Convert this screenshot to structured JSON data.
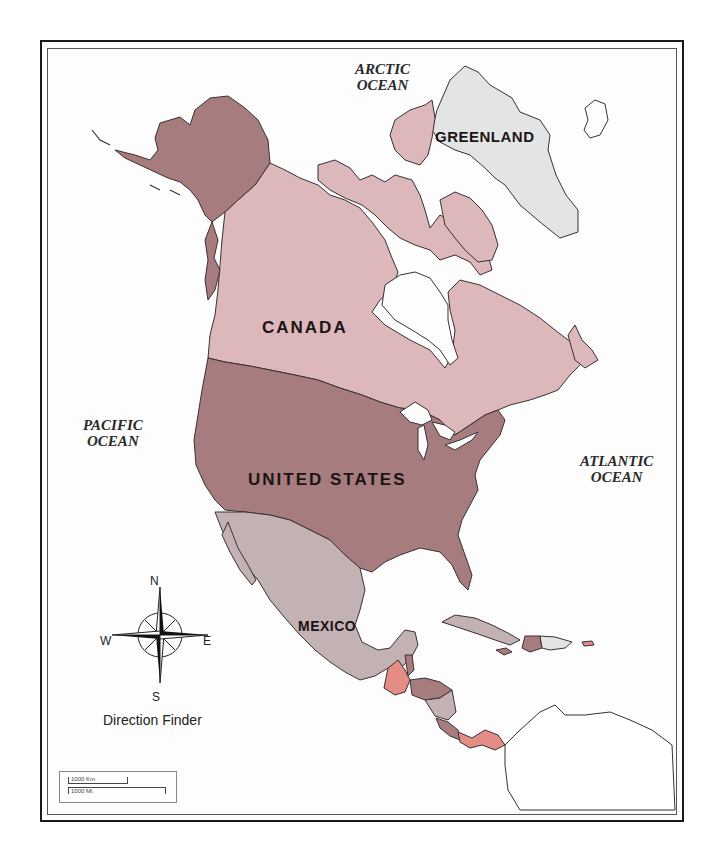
{
  "map": {
    "title": "North America",
    "colors": {
      "alaska_us": "#a67c7e",
      "united_states": "#a67c7e",
      "canada": "#dcb8ba",
      "greenland": "#e3e5e4",
      "mexico": "#c2b2b4",
      "central_america_red": "#e48d86",
      "central_america_dark": "#a67c7e",
      "central_america_gray": "#c2b2b4",
      "water": "#fdfdfd",
      "outline": "#3a3030",
      "south_america": "#ffffff"
    },
    "countries": [
      {
        "id": "canada",
        "label": "CANADA"
      },
      {
        "id": "united-states",
        "label": "UNITED STATES"
      },
      {
        "id": "mexico",
        "label": "MEXICO"
      },
      {
        "id": "greenland",
        "label": "GREENLAND"
      }
    ],
    "oceans": [
      {
        "id": "arctic",
        "line1": "ARCTIC",
        "line2": "OCEAN"
      },
      {
        "id": "pacific",
        "line1": "PACIFIC",
        "line2": "OCEAN"
      },
      {
        "id": "atlantic",
        "line1": "ATLANTIC",
        "line2": "OCEAN"
      }
    ],
    "compass": {
      "north": "N",
      "south": "S",
      "east": "E",
      "west": "W",
      "caption": "Direction Finder"
    },
    "scale": {
      "km_label": "1000 Km",
      "mi_label": "1000 Mi."
    }
  }
}
